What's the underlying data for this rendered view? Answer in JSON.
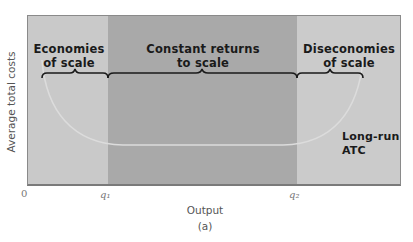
{
  "figure": {
    "caption": "(a)",
    "y_axis_label": "Average total costs",
    "x_axis_label": "Output",
    "origin_label": "0",
    "ticks": [
      {
        "label": "q₁",
        "position": "q1"
      },
      {
        "label": "q₂",
        "position": "q2"
      }
    ],
    "regions": [
      {
        "name": "economies",
        "line1": "Economies",
        "line2": "of scale",
        "color": "#c9c9c9"
      },
      {
        "name": "constant",
        "line1": "Constant returns",
        "line2": "to scale",
        "color": "#a8a8a8"
      },
      {
        "name": "diseconomies",
        "line1": "Diseconomies",
        "line2": "of scale",
        "color": "#cbcbcb"
      }
    ],
    "curve_label": {
      "line1": "Long-run",
      "line2": "ATC"
    },
    "colors": {
      "curve": "#d8d8d8",
      "brace": "#1a1a1a",
      "border": "#8a8a8a"
    }
  }
}
